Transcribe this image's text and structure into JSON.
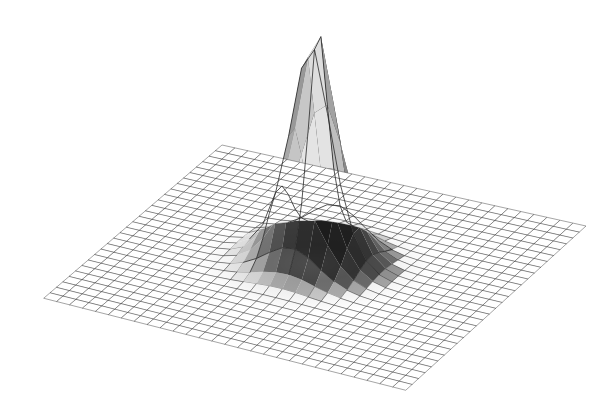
{
  "figure": {
    "title": "",
    "caption": "Three-dimensional mesh surface plot of a sharp unimodal peak rising from a flat rectangular grid plane",
    "background_color": "#ffffff",
    "width": 607,
    "height": 412
  },
  "chart_data": {
    "type": "surface",
    "title": "",
    "subtitle": "",
    "xlabel": "",
    "ylabel": "",
    "zlabel": "",
    "grid": true,
    "legend": null,
    "annotations": [],
    "colormap": "grayscale",
    "render": {
      "mesh_color": "#3c3c3c",
      "mesh_line_width": 0.55,
      "peak_mesh_color": "#2a2a2a",
      "peak_mesh_line_width": 0.8,
      "face_light_color": "#ffffff",
      "face_dark_color": "#1e1e1e",
      "shadow_color": "#9a9a9a",
      "hidden_line_removal": true
    },
    "surface_function": {
      "name": "sharp-gaussian-peak",
      "formula": "z = A * exp(-((x^2 + y^2) / (2 * s^2))^p)",
      "amplitude": 1.0,
      "sigma": 0.115,
      "exponent_p": 0.78,
      "baseline": 0.0,
      "peak_position": [
        0.04,
        -0.02
      ],
      "peak_height_value": 1.0
    },
    "x": {
      "min": -1.0,
      "max": 1.0,
      "divisions": 28,
      "tick_labels": []
    },
    "y": {
      "min": -1.0,
      "max": 1.0,
      "divisions": 28,
      "tick_labels": []
    },
    "zlim": [
      0.0,
      1.0
    ],
    "coarse_mesh_divisions": 8,
    "projection": {
      "type": "axonometric",
      "azimuth_deg": 38,
      "elevation_deg": 22,
      "z_scale": 246,
      "plane_corners_px": {
        "left": [
          44,
          298
        ],
        "top": [
          222,
          145
        ],
        "right": [
          586,
          226
        ],
        "bottom": [
          406,
          390
        ]
      },
      "apex_px": [
        315,
        31
      ]
    },
    "values_note": "Surface heights are generated from the stated peak function over the x/y grid; z ranges 0 at the plane to 1.0 at the apex.",
    "sampled_profile": {
      "radius": [
        0.0,
        0.05,
        0.1,
        0.15,
        0.2,
        0.25,
        0.3,
        0.35,
        0.4,
        0.5,
        0.6,
        0.8,
        1.0
      ],
      "height": [
        1.0,
        0.93,
        0.78,
        0.58,
        0.39,
        0.24,
        0.14,
        0.08,
        0.04,
        0.012,
        0.004,
        0.0005,
        0.0
      ]
    }
  }
}
